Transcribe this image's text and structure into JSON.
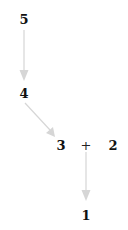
{
  "diagram": {
    "nodes": [
      {
        "id": "n5",
        "label": "5",
        "x": 24,
        "y": 19
      },
      {
        "id": "n4",
        "label": "4",
        "x": 24,
        "y": 93
      },
      {
        "id": "n3",
        "label": "3",
        "x": 61,
        "y": 145
      },
      {
        "id": "plus",
        "label": "+",
        "x": 86,
        "y": 145
      },
      {
        "id": "n2",
        "label": "2",
        "x": 113,
        "y": 145
      },
      {
        "id": "n1",
        "label": "1",
        "x": 86,
        "y": 215
      }
    ],
    "edges": [
      {
        "from": "n5",
        "to": "n4"
      },
      {
        "from": "n4",
        "to": "n3"
      },
      {
        "from": "plus",
        "to": "n1"
      }
    ],
    "edge_color": "#d6d6d6"
  }
}
